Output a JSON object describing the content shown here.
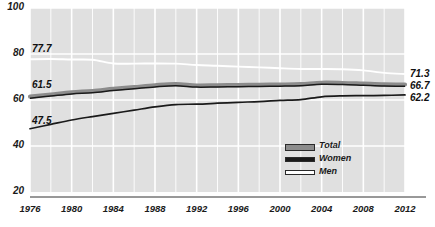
{
  "chart_data": {
    "type": "line",
    "title": "",
    "xlabel": "",
    "ylabel": "",
    "xlim": [
      1976,
      2012
    ],
    "ylim": [
      20,
      100
    ],
    "yticks": [
      20,
      40,
      60,
      80,
      100
    ],
    "xticks": [
      1976,
      1980,
      1984,
      1988,
      1992,
      1996,
      2000,
      2004,
      2008,
      2012
    ],
    "grid": true,
    "legend_position": "bottom-right",
    "x": [
      1976,
      1978,
      1980,
      1982,
      1984,
      1986,
      1988,
      1990,
      1992,
      1994,
      1996,
      1998,
      2000,
      2002,
      2004,
      2006,
      2008,
      2010,
      2012
    ],
    "series": [
      {
        "name": "Total",
        "color": "#8c8c8c",
        "start_label": "61.5",
        "end_label": "66.7",
        "values": [
          61.5,
          62.4,
          63.3,
          63.9,
          64.8,
          65.6,
          66.4,
          66.9,
          66.3,
          66.4,
          66.5,
          66.6,
          66.7,
          66.9,
          67.5,
          67.4,
          67.1,
          66.8,
          66.7
        ]
      },
      {
        "name": "Women",
        "color": "#1a1a1a",
        "start_label": "47.5",
        "end_label": "62.2",
        "values": [
          47.5,
          49.4,
          51.3,
          52.8,
          54.2,
          55.6,
          57.0,
          58.0,
          58.2,
          58.6,
          59.0,
          59.3,
          59.8,
          60.2,
          61.4,
          61.8,
          61.9,
          62.0,
          62.2
        ]
      },
      {
        "name": "Men",
        "color": "#ffffff",
        "start_label": "77.7",
        "end_label": "71.3",
        "values": [
          77.7,
          77.8,
          77.6,
          77.5,
          75.9,
          75.8,
          75.9,
          75.8,
          75.2,
          74.9,
          74.5,
          74.2,
          73.8,
          73.5,
          73.5,
          73.4,
          72.9,
          71.8,
          71.3
        ]
      }
    ],
    "legend": [
      {
        "label": "Total",
        "swatch": "#8c8c8c"
      },
      {
        "label": "Women",
        "swatch": "#1a1a1a"
      },
      {
        "label": "Men",
        "swatch": "#ffffff"
      }
    ],
    "plot_background": "#e0e0e0",
    "gridline_color": "#ffffff",
    "axis_color": "#333333"
  }
}
